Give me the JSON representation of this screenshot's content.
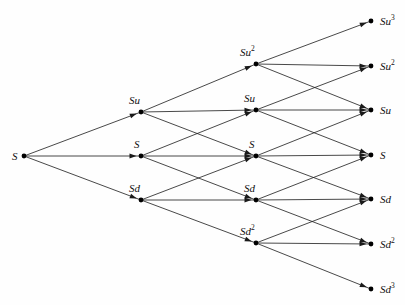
{
  "figure": {
    "type": "diagram",
    "background_color": "#fefefe",
    "line_color": "#1a1a1a",
    "node_color": "#000000",
    "label_color": "#111111",
    "width": 405,
    "height": 305
  },
  "diagram_data": {
    "type": "trinomial-lattice",
    "steps": 3,
    "branching": 3,
    "columns": [
      {
        "index": 0,
        "x": 24,
        "nodes": [
          {
            "id": "n0_0",
            "label_base": "S",
            "label_sup": "",
            "y": 156,
            "label_pos": "left"
          }
        ]
      },
      {
        "index": 1,
        "x": 141,
        "nodes": [
          {
            "id": "n1_u",
            "label_base": "Su",
            "label_sup": "",
            "y": 112,
            "label_pos": "above"
          },
          {
            "id": "n1_m",
            "label_base": "S",
            "label_sup": "",
            "y": 156,
            "label_pos": "above"
          },
          {
            "id": "n1_d",
            "label_base": "Sd",
            "label_sup": "",
            "y": 200,
            "label_pos": "above"
          }
        ]
      },
      {
        "index": 2,
        "x": 256,
        "nodes": [
          {
            "id": "n2_uu",
            "label_base": "Su",
            "label_sup": "2",
            "y": 64,
            "label_pos": "above"
          },
          {
            "id": "n2_u",
            "label_base": "Su",
            "label_sup": "",
            "y": 110,
            "label_pos": "above"
          },
          {
            "id": "n2_m",
            "label_base": "S",
            "label_sup": "",
            "y": 156,
            "label_pos": "above"
          },
          {
            "id": "n2_d",
            "label_base": "Sd",
            "label_sup": "",
            "y": 200,
            "label_pos": "above"
          },
          {
            "id": "n2_dd",
            "label_base": "Sd",
            "label_sup": "2",
            "y": 243,
            "label_pos": "above"
          }
        ]
      },
      {
        "index": 3,
        "x": 371,
        "nodes": [
          {
            "id": "n3_uuu",
            "label_base": "Su",
            "label_sup": "3",
            "y": 21,
            "label_pos": "right"
          },
          {
            "id": "n3_uu",
            "label_base": "Su",
            "label_sup": "2",
            "y": 66,
            "label_pos": "right"
          },
          {
            "id": "n3_u",
            "label_base": "Su",
            "label_sup": "",
            "y": 110,
            "label_pos": "right"
          },
          {
            "id": "n3_m",
            "label_base": "S",
            "label_sup": "",
            "y": 155,
            "label_pos": "right"
          },
          {
            "id": "n3_d",
            "label_base": "Sd",
            "label_sup": "",
            "y": 199,
            "label_pos": "right"
          },
          {
            "id": "n3_dd",
            "label_base": "Sd",
            "label_sup": "2",
            "y": 244,
            "label_pos": "right"
          },
          {
            "id": "n3_ddd",
            "label_base": "Sd",
            "label_sup": "3",
            "y": 289,
            "label_pos": "right"
          }
        ]
      }
    ],
    "edges": [
      {
        "from": "n0_0",
        "to": "n1_u",
        "branch": "up"
      },
      {
        "from": "n0_0",
        "to": "n1_m",
        "branch": "middle"
      },
      {
        "from": "n0_0",
        "to": "n1_d",
        "branch": "down"
      },
      {
        "from": "n1_u",
        "to": "n2_uu",
        "branch": "up"
      },
      {
        "from": "n1_u",
        "to": "n2_u",
        "branch": "middle"
      },
      {
        "from": "n1_u",
        "to": "n2_m",
        "branch": "down"
      },
      {
        "from": "n1_m",
        "to": "n2_u",
        "branch": "up"
      },
      {
        "from": "n1_m",
        "to": "n2_m",
        "branch": "middle"
      },
      {
        "from": "n1_m",
        "to": "n2_d",
        "branch": "down"
      },
      {
        "from": "n1_d",
        "to": "n2_m",
        "branch": "up"
      },
      {
        "from": "n1_d",
        "to": "n2_d",
        "branch": "middle"
      },
      {
        "from": "n1_d",
        "to": "n2_dd",
        "branch": "down"
      },
      {
        "from": "n2_uu",
        "to": "n3_uuu",
        "branch": "up"
      },
      {
        "from": "n2_uu",
        "to": "n3_uu",
        "branch": "middle"
      },
      {
        "from": "n2_uu",
        "to": "n3_u",
        "branch": "down"
      },
      {
        "from": "n2_u",
        "to": "n3_uu",
        "branch": "up"
      },
      {
        "from": "n2_u",
        "to": "n3_u",
        "branch": "middle"
      },
      {
        "from": "n2_u",
        "to": "n3_m",
        "branch": "down"
      },
      {
        "from": "n2_m",
        "to": "n3_u",
        "branch": "up"
      },
      {
        "from": "n2_m",
        "to": "n3_m",
        "branch": "middle"
      },
      {
        "from": "n2_m",
        "to": "n3_d",
        "branch": "down"
      },
      {
        "from": "n2_d",
        "to": "n3_m",
        "branch": "up"
      },
      {
        "from": "n2_d",
        "to": "n3_d",
        "branch": "middle"
      },
      {
        "from": "n2_d",
        "to": "n3_dd",
        "branch": "down"
      },
      {
        "from": "n2_dd",
        "to": "n3_d",
        "branch": "up"
      },
      {
        "from": "n2_dd",
        "to": "n3_dd",
        "branch": "middle"
      },
      {
        "from": "n2_dd",
        "to": "n3_ddd",
        "branch": "down"
      }
    ]
  }
}
